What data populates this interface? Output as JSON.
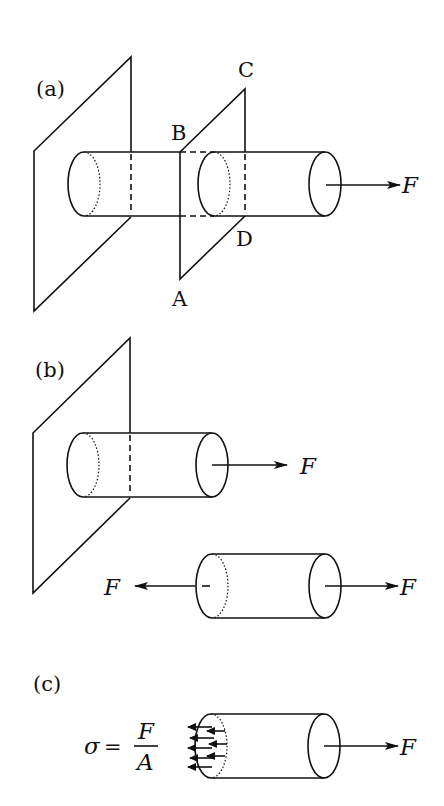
{
  "figure": {
    "panels": [
      {
        "id": "a",
        "label": "(a)",
        "description": "Bar fixed in a wall plane, pulled by force F, with a cutting plane ABCD",
        "points": {
          "A": "A",
          "B": "B",
          "C": "C",
          "D": "D"
        },
        "force_label": "F"
      },
      {
        "id": "b",
        "label": "(b)",
        "description": "Bar sectioned: fixed part with force F, and free body with equal and opposite forces F",
        "force_label_fixed": "F",
        "force_label_free_left": "F",
        "force_label_free_right": "F"
      },
      {
        "id": "c",
        "label": "(c)",
        "description": "Stress distributed uniformly over cross-section",
        "formula": {
          "lhs": "σ",
          "eq": "=",
          "numerator": "F",
          "denominator": "A"
        },
        "force_label": "F"
      }
    ],
    "colors": {
      "line": "#111111",
      "background": "#ffffff"
    }
  }
}
